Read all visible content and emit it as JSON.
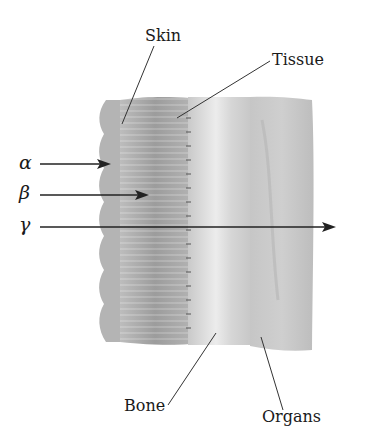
{
  "diagram": {
    "type": "radiation-penetration-cross-section",
    "layers": [
      {
        "name": "Skin",
        "label": "Skin"
      },
      {
        "name": "Tissue",
        "label": "Tissue"
      },
      {
        "name": "Bone",
        "label": "Bone"
      },
      {
        "name": "Organs",
        "label": "Organs"
      }
    ],
    "rays": [
      {
        "symbol": "α",
        "name": "alpha",
        "stops_at": "Skin"
      },
      {
        "symbol": "β",
        "name": "beta",
        "stops_at": "Tissue"
      },
      {
        "symbol": "γ",
        "name": "gamma",
        "stops_at": "passes through"
      }
    ]
  },
  "labels": {
    "skin": "Skin",
    "tissue": "Tissue",
    "bone": "Bone",
    "organs": "Organs",
    "alpha": "α",
    "beta": "β",
    "gamma": "γ"
  },
  "colors": {
    "line": "#222222",
    "skin": "#b9b9b9",
    "tissue": "#a9a9a9",
    "bone": "#d8d8d8",
    "organs": "#c4c4c4"
  }
}
